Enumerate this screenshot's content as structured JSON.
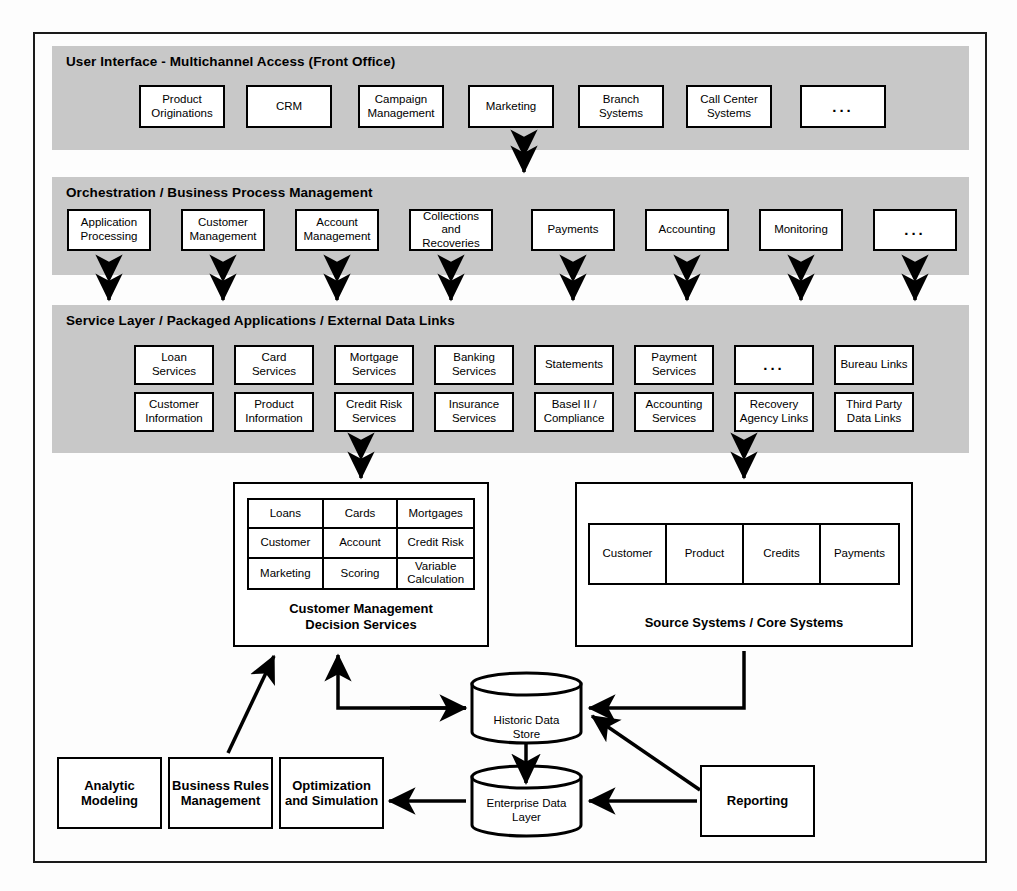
{
  "bands": [
    {
      "id": "ui",
      "title": "User Interface - Multichannel Access (Front Office)",
      "items": [
        {
          "label": "Product Originations"
        },
        {
          "label": "CRM"
        },
        {
          "label": "Campaign Management"
        },
        {
          "label": "Marketing"
        },
        {
          "label": "Branch Systems"
        },
        {
          "label": "Call Center Systems"
        },
        {
          "label": "..."
        }
      ]
    },
    {
      "id": "orchestration",
      "title": "Orchestration / Business Process Management",
      "items": [
        {
          "label": "Application Processing"
        },
        {
          "label": "Customer Management"
        },
        {
          "label": "Account Management"
        },
        {
          "label": "Collections and Recoveries"
        },
        {
          "label": "Payments"
        },
        {
          "label": "Accounting"
        },
        {
          "label": "Monitoring"
        },
        {
          "label": "..."
        }
      ]
    },
    {
      "id": "service",
      "title": "Service Layer / Packaged Applications / External Data Links",
      "items_row1": [
        {
          "label": "Loan Services"
        },
        {
          "label": "Card Services"
        },
        {
          "label": "Mortgage Services"
        },
        {
          "label": "Banking Services"
        },
        {
          "label": "Statements"
        },
        {
          "label": "Payment Services"
        },
        {
          "label": "..."
        },
        {
          "label": "Bureau Links"
        }
      ],
      "items_row2": [
        {
          "label": "Customer Information"
        },
        {
          "label": "Product Information"
        },
        {
          "label": "Credit Risk Services"
        },
        {
          "label": "Insurance Services"
        },
        {
          "label": "Basel II / Compliance"
        },
        {
          "label": "Accounting Services"
        },
        {
          "label": "Recovery Agency Links"
        },
        {
          "label": "Third Party Data Links"
        }
      ]
    }
  ],
  "decision_services": {
    "caption": "Customer Management\nDecision Services",
    "caption_line1": "Customer Management",
    "caption_line2": "Decision Services",
    "grid": [
      [
        "Loans",
        "Cards",
        "Mortgages"
      ],
      [
        "Customer",
        "Account",
        "Credit Risk"
      ],
      [
        "Marketing",
        "Scoring",
        "Variable Calculation"
      ]
    ]
  },
  "source_systems": {
    "caption": "Source Systems / Core Systems",
    "columns": [
      "Customer",
      "Product",
      "Credits",
      "Payments"
    ]
  },
  "data_stores": [
    {
      "id": "historic",
      "line1": "Historic Data",
      "line2": "Store"
    },
    {
      "id": "enterprise",
      "line1": "Enterprise Data",
      "line2": "Layer"
    }
  ],
  "analytics": [
    {
      "label": "Analytic Modeling"
    },
    {
      "label": "Business Rules Management"
    },
    {
      "label": "Optimization and Simulation"
    }
  ],
  "reporting": {
    "label": "Reporting"
  },
  "colors": {
    "band_fill": "#c8c8c8",
    "stroke": "#000000",
    "node_fill": "#ffffff",
    "page_bg": "#fdfdfd"
  }
}
